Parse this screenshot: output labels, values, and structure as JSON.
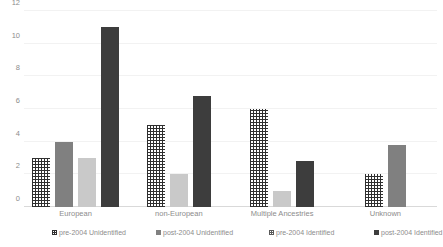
{
  "chart_data": {
    "type": "bar",
    "title": "",
    "subtitle": "",
    "xlabel": "",
    "ylabel": "",
    "ylim": [
      0,
      12
    ],
    "ytick_labels": [
      "0",
      "2",
      "4",
      "6",
      "8",
      "10",
      "12"
    ],
    "ytick_values": [
      0,
      2,
      4,
      6,
      8,
      10,
      12
    ],
    "grid": true,
    "legend_position": "bottom",
    "categories": [
      "European",
      "non-European",
      "Multiple Ancestries",
      "Unknown"
    ],
    "series": [
      {
        "name": "pre-2004 Unidentified",
        "style": "hatch-dark",
        "values": [
          3,
          5,
          6,
          2
        ]
      },
      {
        "name": "post-2004 Unidentified",
        "style": "solid-mid",
        "values": [
          4,
          0,
          0,
          3.8
        ]
      },
      {
        "name": "pre-2004 Identified",
        "style": "solid-light",
        "values": [
          3,
          2,
          1,
          0
        ]
      },
      {
        "name": "post-2004 Identified",
        "style": "solid-dark",
        "values": [
          11,
          6.8,
          2.8,
          0
        ]
      }
    ]
  },
  "legend": {
    "items": [
      {
        "label": "pre-2004 Unidentified",
        "style": "hatch-dark"
      },
      {
        "label": "post-2004 Unidentified",
        "style": "solid-mid"
      },
      {
        "label": "pre-2004 Identified",
        "style": "hatch-mid"
      },
      {
        "label": "post-2004 Identified",
        "style": "solid-dark"
      }
    ],
    "x_positions": [
      28,
      132,
      245,
      350
    ]
  },
  "colors": {
    "series_mid": "#808080",
    "series_light": "#c9c9c9",
    "series_dark": "#3d3d3d",
    "hatch": "#2f2f2f",
    "gridline": "#f2f2f2",
    "axis": "#d9d9d9",
    "text": "#8c8c8c",
    "background": "#ffffff"
  }
}
